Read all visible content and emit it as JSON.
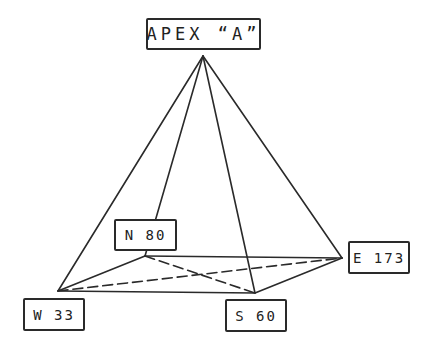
{
  "diagram": {
    "type": "pyramid-wireframe",
    "apex": {
      "id": "A",
      "label": "APEX “A”"
    },
    "base_vertices": [
      {
        "id": "N",
        "label": "N 80",
        "direction": "N",
        "value": 80
      },
      {
        "id": "E",
        "label": "E 173",
        "direction": "E",
        "value": 173
      },
      {
        "id": "S",
        "label": "S 60",
        "direction": "S",
        "value": 60
      },
      {
        "id": "W",
        "label": "W 33",
        "direction": "W",
        "value": 33
      }
    ],
    "edges": {
      "apex_to_base": [
        "A-W",
        "A-N",
        "A-S",
        "A-E"
      ],
      "base_solid": [
        "W-N",
        "W-S",
        "S-E",
        "N-E"
      ],
      "diagonals_dashed": [
        "W-E",
        "N-S"
      ]
    },
    "line_color": "#2a2a2a"
  }
}
